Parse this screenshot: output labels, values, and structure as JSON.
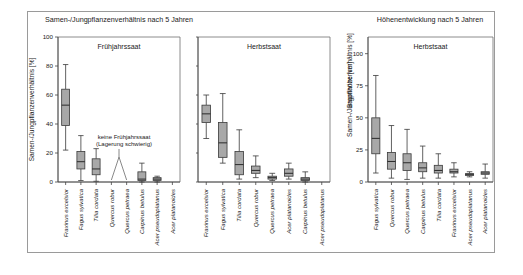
{
  "figure": {
    "background_color": "#ffffff",
    "frame_color": "#9a9a9a",
    "box_fill": "#a8a8a8",
    "line_color": "#3a3a3a"
  },
  "titles": {
    "left_group": "Samen-/Jungpflanzenverhältnis nach 5 Jahren",
    "right_group": "Höhenentwicklung nach 5 Jahren"
  },
  "panels": {
    "p1": {
      "header": "Frühjahrssaat",
      "ylabel": "Samen-/Jungpflanzenverhältnis [%]"
    },
    "p2": {
      "header": "Herbstsaat"
    },
    "p3": {
      "header": "Herbstsaat",
      "ylabel": "Baumhöhe [cm]"
    }
  },
  "annotation": {
    "line1": "keine Frühjahrssaat",
    "line2": "(Lagerung schwierig)"
  },
  "yticks": {
    "percent": [
      "0",
      "20",
      "40",
      "60",
      "80",
      "100"
    ],
    "height": [
      "0",
      "25",
      "50",
      "75",
      "100"
    ]
  },
  "chart_data": [
    {
      "type": "box",
      "title": "Samen-/Jungpflanzenverhältnis nach 5 Jahren",
      "panel": "Frühjahrssaat",
      "ylabel": "Samen-/Jungpflanzenverhältnis [%]",
      "xlabel": "",
      "ylim": [
        0,
        100
      ],
      "yticks": [
        0,
        20,
        40,
        60,
        80,
        100
      ],
      "grid": false,
      "legend": "none",
      "categories": [
        "Fraxinus excelsior",
        "Fagus sylvatica",
        "Tilia cordata",
        "Quercus robur",
        "Quercus petraea",
        "Carpinus betulus",
        "Acer pseudoplatanus",
        "Acer platanoides"
      ],
      "boxes": [
        {
          "category": "Fraxinus excelsior",
          "min": 22,
          "q1": 39,
          "median": 53,
          "q3": 64,
          "max": 81
        },
        {
          "category": "Fagus sylvatica",
          "min": 1,
          "q1": 9,
          "median": 14,
          "q3": 21,
          "max": 32
        },
        {
          "category": "Tilia cordata",
          "min": 0.5,
          "q1": 5,
          "median": 9,
          "q3": 16,
          "max": 23
        },
        {
          "category": "Quercus robur",
          "missing": true
        },
        {
          "category": "Quercus petraea",
          "missing": true
        },
        {
          "category": "Carpinus betulus",
          "min": 0,
          "q1": 1,
          "median": 2,
          "q3": 7,
          "max": 13
        },
        {
          "category": "Acer pseudoplatanus",
          "min": 0,
          "q1": 1,
          "median": 2,
          "q3": 3,
          "max": 4
        },
        {
          "category": "Acer platanoides",
          "missing": true
        }
      ],
      "annotations": [
        {
          "text": "keine Frühjahrssaat (Lagerung schwierig)",
          "points_to": [
            "Quercus robur",
            "Quercus petraea"
          ]
        }
      ]
    },
    {
      "type": "box",
      "title": "Samen-/Jungpflanzenverhältnis nach 5 Jahren",
      "panel": "Herbstsaat",
      "ylabel": "Samen-/Jungpflanzenverhältnis [%]",
      "xlabel": "",
      "ylim": [
        0,
        100
      ],
      "yticks": [
        0,
        20,
        40,
        60,
        80,
        100
      ],
      "grid": false,
      "legend": "none",
      "categories": [
        "Fraxinus excelsior",
        "Fagus sylvatica",
        "Tilia cordata",
        "Quercus robur",
        "Quercus petraea",
        "Acer platanoides",
        "Carpinus betulus",
        "Acer pseudoplatanus"
      ],
      "boxes": [
        {
          "category": "Fraxinus excelsior",
          "min": 30,
          "q1": 41,
          "median": 47,
          "q3": 53,
          "max": 60
        },
        {
          "category": "Fagus sylvatica",
          "min": 13,
          "q1": 17,
          "median": 27,
          "q3": 41,
          "max": 61
        },
        {
          "category": "Tilia cordata",
          "min": 2,
          "q1": 5,
          "median": 12,
          "q3": 21,
          "max": 36
        },
        {
          "category": "Quercus robur",
          "min": 3,
          "q1": 6,
          "median": 8,
          "q3": 11,
          "max": 18
        },
        {
          "category": "Quercus petraea",
          "min": 1,
          "q1": 2,
          "median": 3,
          "q3": 4,
          "max": 6
        },
        {
          "category": "Acer platanoides",
          "min": 2,
          "q1": 4,
          "median": 6,
          "q3": 9,
          "max": 13
        },
        {
          "category": "Carpinus betulus",
          "min": 0,
          "q1": 1,
          "median": 2,
          "q3": 3,
          "max": 7
        },
        {
          "category": "Acer pseudoplatanus",
          "missing": true
        }
      ]
    },
    {
      "type": "box",
      "title": "Höhenentwicklung nach 5 Jahren",
      "panel": "Herbstsaat",
      "ylabel": "Baumhöhe [cm]",
      "xlabel": "",
      "ylim": [
        0,
        113
      ],
      "yticks": [
        0,
        25,
        50,
        75,
        100
      ],
      "grid": false,
      "legend": "none",
      "categories": [
        "Fagus sylvatica",
        "Quercus robur",
        "Quercus petraea",
        "Carpinus betulus",
        "Tilia cordata",
        "Fraxinus excelsior",
        "Acer pseudoplatanus",
        "Acer platanoides"
      ],
      "boxes": [
        {
          "category": "Fagus sylvatica",
          "min": 7,
          "q1": 22,
          "median": 34,
          "q3": 50,
          "max": 83
        },
        {
          "category": "Quercus robur",
          "min": 3,
          "q1": 10,
          "median": 16,
          "q3": 23,
          "max": 44
        },
        {
          "category": "Quercus petraea",
          "min": 2,
          "q1": 9,
          "median": 15,
          "q3": 22,
          "max": 41
        },
        {
          "category": "Carpinus betulus",
          "min": 3,
          "q1": 8,
          "median": 11,
          "q3": 15,
          "max": 28
        },
        {
          "category": "Tilia cordata",
          "min": 3,
          "q1": 7,
          "median": 9,
          "q3": 13,
          "max": 22
        },
        {
          "category": "Fraxinus excelsior",
          "min": 4,
          "q1": 7,
          "median": 8,
          "q3": 10,
          "max": 15
        },
        {
          "category": "Acer pseudoplatanus",
          "min": 4,
          "q1": 5,
          "median": 6,
          "q3": 6.5,
          "max": 8
        },
        {
          "category": "Acer platanoides",
          "min": 3,
          "q1": 6,
          "median": 7,
          "q3": 8,
          "max": 14
        }
      ]
    }
  ]
}
